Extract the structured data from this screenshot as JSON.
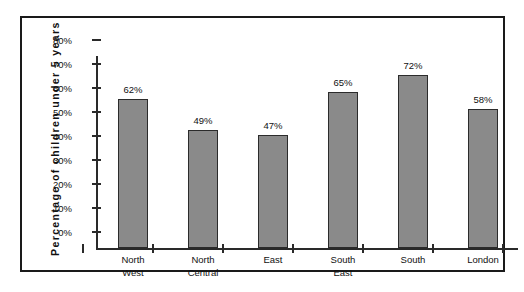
{
  "chart_data": {
    "type": "bar",
    "title": "",
    "xlabel": "",
    "ylabel": "Percentage of children under 5 years",
    "categories": [
      "North West",
      "North Central",
      "East",
      "South East",
      "South",
      "London"
    ],
    "category_lines": [
      [
        "North",
        "West"
      ],
      [
        "North",
        "Central"
      ],
      [
        "East",
        ""
      ],
      [
        "South",
        "East"
      ],
      [
        "South",
        ""
      ],
      [
        "London",
        ""
      ]
    ],
    "values": [
      62,
      49,
      47,
      65,
      72,
      58
    ],
    "value_labels": [
      "62%",
      "49%",
      "47%",
      "65%",
      "72%",
      "58%"
    ],
    "ylim": [
      0,
      80
    ],
    "ytick_values": [
      0,
      10,
      20,
      30,
      40,
      50,
      60,
      70,
      80
    ],
    "ytick_labels": [
      "0%",
      "10%",
      "20%",
      "30%",
      "40%",
      "50%",
      "60%",
      "70%",
      "80%"
    ],
    "grid": false,
    "legend": "none",
    "bar_fill_color": "#8a8a8a",
    "bar_border_color": "#2b2b2b",
    "axis_color": "#2a2a2a",
    "frame_color": "#1a1a1a",
    "background_color": "#ffffff"
  }
}
